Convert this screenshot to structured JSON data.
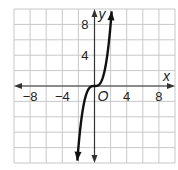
{
  "chart_data": {
    "type": "line",
    "title": "",
    "xlabel": "x",
    "ylabel": "y",
    "origin_label": "O",
    "xlim": [
      -10,
      10
    ],
    "ylim": [
      -10,
      10
    ],
    "grid": true,
    "grid_step": 2,
    "x_tick_labels": [
      "−8",
      "−4",
      "4",
      "8"
    ],
    "x_tick_values": [
      -8,
      -4,
      4,
      8
    ],
    "y_tick_labels": [
      "4",
      "8"
    ],
    "y_tick_values": [
      4,
      8
    ],
    "series": [
      {
        "name": "y = x^3",
        "x": [
          -2.15,
          -2,
          -1.5,
          -1,
          -0.5,
          0,
          0.5,
          1,
          1.5,
          2,
          2.15
        ],
        "y": [
          -9.94,
          -8,
          -3.375,
          -1,
          -0.125,
          0,
          0.125,
          1,
          3.375,
          8,
          9.94
        ],
        "arrows_at_ends": true
      }
    ]
  }
}
